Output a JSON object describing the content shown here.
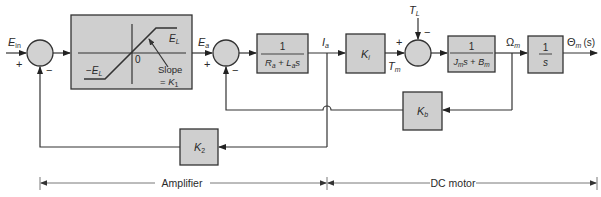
{
  "diagram": {
    "signals": {
      "input": {
        "base": "E",
        "sub": "in"
      },
      "amp_out": {
        "base": "E",
        "sub": "a"
      },
      "current": {
        "base": "I",
        "sub": "a"
      },
      "torque": {
        "base": "T",
        "sub": "m"
      },
      "load": {
        "base": "T",
        "sub": "L"
      },
      "speed": {
        "base": "Ω",
        "sub": "m"
      },
      "output": {
        "base": "Θ",
        "sub": "m",
        "arg": "(s)"
      }
    },
    "summing_junctions": [
      {
        "id": "sum1",
        "signs": {
          "left": "+",
          "bottom": "−"
        }
      },
      {
        "id": "sum2",
        "signs": {
          "left": "+",
          "bottom": "−"
        }
      },
      {
        "id": "sum3",
        "signs": {
          "left": "+",
          "top": "−"
        }
      }
    ],
    "blocks": {
      "saturation": {
        "upper_label": {
          "base": "E",
          "sub": "L"
        },
        "lower_label": {
          "prefix": "−",
          "base": "E",
          "sub": "L"
        },
        "origin": "0",
        "slope_line1": "Slope",
        "slope_line2_prefix": "= ",
        "slope_base": "K",
        "slope_sub": "1"
      },
      "armature": {
        "numerator": "1",
        "den_R": "R",
        "den_R_sub": "a",
        "den_plus": " + ",
        "den_L": "L",
        "den_L_sub": "a",
        "den_s": "s"
      },
      "torque_const": {
        "base": "K",
        "sub": "i"
      },
      "mechanical": {
        "numerator": "1",
        "den_J": "J",
        "den_J_sub": "m",
        "den_s": "s",
        "den_plus": " + ",
        "den_B": "B",
        "den_B_sub": "m"
      },
      "integrator": {
        "numerator": "1",
        "denominator": "s"
      },
      "back_emf": {
        "base": "K",
        "sub": "b"
      },
      "current_fb": {
        "base": "K",
        "sub": "2"
      }
    },
    "dimensions": {
      "amplifier_label": "Amplifier",
      "motor_label": "DC motor"
    }
  }
}
